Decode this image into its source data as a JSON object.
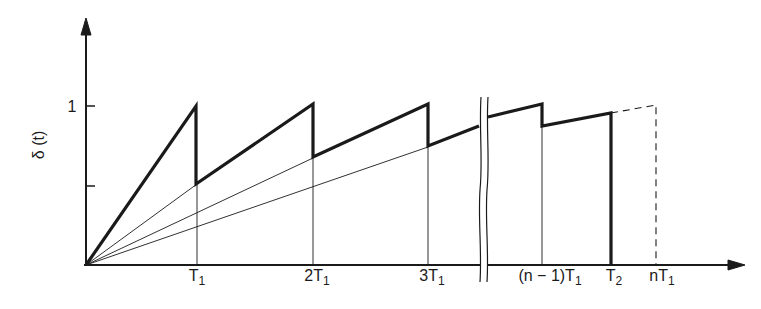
{
  "diagram": {
    "y_axis": {
      "label": "δ (t)",
      "tick_labels": [
        "1"
      ]
    },
    "x_axis": {
      "tick_labels": [
        {
          "main": "T",
          "sub": "1"
        },
        {
          "main": "2T",
          "sub": "1"
        },
        {
          "main": "3T",
          "sub": "1"
        },
        {
          "main": "(n − 1)T",
          "sub": "1"
        },
        {
          "main": "T",
          "sub": "2"
        },
        {
          "main": "nT",
          "sub": "1"
        }
      ]
    },
    "colors": {
      "ink": "#1a1a1a",
      "background": "#ffffff"
    }
  }
}
